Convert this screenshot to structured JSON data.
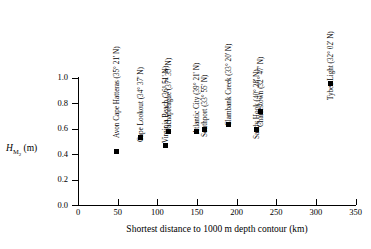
{
  "chart_data": {
    "type": "scatter",
    "title": "",
    "xlabel": "Shortest distance to 1000 m depth contour (km)",
    "ylabel": "H_M2 (m)",
    "ylabel_parts": {
      "symbol": "H",
      "subscript": "M2",
      "unit": "(m)"
    },
    "xlim": [
      0,
      350
    ],
    "ylim": [
      0.0,
      1.0
    ],
    "xticks": [
      "0",
      "50",
      "100",
      "150",
      "200",
      "250",
      "300",
      "350"
    ],
    "yticks": [
      "0.0",
      "0.2",
      "0.4",
      "0.6",
      "0.8",
      "1.0"
    ],
    "grid": false,
    "legend": "none",
    "marker_style": "filled-square",
    "marker_color": "#000000",
    "points": [
      {
        "label": "Avon Cape Hatteras (35° 21' N)",
        "x": 48,
        "y": 0.42
      },
      {
        "label": "Cape Lookout (34° 37' N)",
        "x": 79,
        "y": 0.53
      },
      {
        "label": "Virginia Beach (36° 51' N)",
        "x": 110,
        "y": 0.47
      },
      {
        "label": "Wachapreague (37° 35' N)",
        "x": 114,
        "y": 0.58
      },
      {
        "label": "Atlantic City (39° 21' N)",
        "x": 150,
        "y": 0.575
      },
      {
        "label": "Southport (33° 55' N)",
        "x": 159,
        "y": 0.595
      },
      {
        "label": "Clambank Creek (33° 20' N)",
        "x": 190,
        "y": 0.635
      },
      {
        "label": "Sandy Hook (40° 28' N)",
        "x": 225,
        "y": 0.595
      },
      {
        "label": "Charlestown (32° 47' N)",
        "x": 230,
        "y": 0.735
      },
      {
        "label": "Tybee Light (32° 02' N)",
        "x": 318,
        "y": 0.955
      }
    ],
    "label_anchor_y": [
      138,
      142,
      143,
      134,
      134,
      137,
      126,
      139,
      127,
      100
    ]
  }
}
